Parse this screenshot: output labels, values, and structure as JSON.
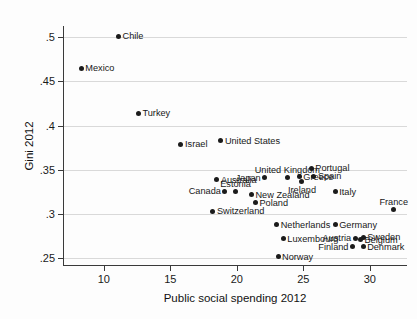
{
  "chart_data": {
    "type": "scatter",
    "title": "",
    "xlabel": "Public social spending 2012",
    "ylabel": "Gini 2012",
    "xlim": [
      7.0,
      32.8
    ],
    "ylim": [
      0.2425,
      0.5125
    ],
    "xticks": [
      10,
      15,
      20,
      25,
      30
    ],
    "xtick_labels": [
      "10",
      "15",
      "20",
      "25",
      "30"
    ],
    "yticks": [
      0.25,
      0.3,
      0.35,
      0.4,
      0.45,
      0.5
    ],
    "ytick_labels": [
      ".25",
      ".3",
      ".35",
      ".4",
      ".45",
      ".5"
    ],
    "grid": "horizontal",
    "legend": "none",
    "points": [
      {
        "label": "Chile",
        "x": 11.1,
        "y": 0.501,
        "pos": "right"
      },
      {
        "label": "Mexico",
        "x": 8.3,
        "y": 0.465,
        "pos": "right"
      },
      {
        "label": "Turkey",
        "x": 12.6,
        "y": 0.414,
        "pos": "right"
      },
      {
        "label": "Israel",
        "x": 15.8,
        "y": 0.379,
        "pos": "right"
      },
      {
        "label": "United States",
        "x": 18.8,
        "y": 0.383,
        "pos": "right"
      },
      {
        "label": "United Kingdom",
        "x": 23.8,
        "y": 0.341,
        "pos": "above"
      },
      {
        "label": "Portugal",
        "x": 25.6,
        "y": 0.352,
        "pos": "right"
      },
      {
        "label": "Spain",
        "x": 25.8,
        "y": 0.343,
        "pos": "right"
      },
      {
        "label": "Greece",
        "x": 24.7,
        "y": 0.342,
        "pos": "right"
      },
      {
        "label": "Ireland",
        "x": 24.9,
        "y": 0.337,
        "pos": "below"
      },
      {
        "label": "Japan",
        "x": 22.1,
        "y": 0.341,
        "pos": "left"
      },
      {
        "label": "Australia",
        "x": 18.5,
        "y": 0.339,
        "pos": "right"
      },
      {
        "label": "Estonia",
        "x": 19.9,
        "y": 0.325,
        "pos": "above"
      },
      {
        "label": "Canada",
        "x": 19.1,
        "y": 0.326,
        "pos": "left"
      },
      {
        "label": "New Zealand",
        "x": 21.1,
        "y": 0.322,
        "pos": "right"
      },
      {
        "label": "Italy",
        "x": 27.4,
        "y": 0.325,
        "pos": "right"
      },
      {
        "label": "Poland",
        "x": 21.4,
        "y": 0.313,
        "pos": "right"
      },
      {
        "label": "Switzerland",
        "x": 18.2,
        "y": 0.303,
        "pos": "right"
      },
      {
        "label": "France",
        "x": 31.8,
        "y": 0.305,
        "pos": "above"
      },
      {
        "label": "Netherlands",
        "x": 23.0,
        "y": 0.288,
        "pos": "right"
      },
      {
        "label": "Germany",
        "x": 27.4,
        "y": 0.288,
        "pos": "right"
      },
      {
        "label": "Luxembourg",
        "x": 23.5,
        "y": 0.272,
        "pos": "right"
      },
      {
        "label": "Austria",
        "x": 28.9,
        "y": 0.273,
        "pos": "left"
      },
      {
        "label": "Sweden",
        "x": 29.5,
        "y": 0.274,
        "pos": "right"
      },
      {
        "label": "Belgium",
        "x": 29.3,
        "y": 0.271,
        "pos": "right"
      },
      {
        "label": "Finland",
        "x": 28.7,
        "y": 0.263,
        "pos": "left"
      },
      {
        "label": "Denmark",
        "x": 29.5,
        "y": 0.263,
        "pos": "right"
      },
      {
        "label": "Norway",
        "x": 23.1,
        "y": 0.252,
        "pos": "right"
      }
    ],
    "colors": {
      "point": "#1b1b1b",
      "grid": "#d9d9d9",
      "axis": "#3a3a3a",
      "text": "#171717"
    }
  }
}
